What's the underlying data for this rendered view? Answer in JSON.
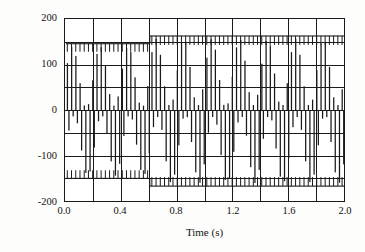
{
  "chart_data": {
    "type": "line",
    "title": "",
    "xlabel": "Time (s)",
    "ylabel": "Terminal voltage (V)",
    "xlim": [
      0.0,
      2.0
    ],
    "ylim": [
      -200,
      200
    ],
    "grid": true,
    "legend": "none",
    "x_major_ticks": [
      0.0,
      0.4,
      0.8,
      1.2,
      1.6,
      2.0
    ],
    "x_minor_ticks": [
      0.2,
      0.6,
      1.0,
      1.4,
      1.8
    ],
    "x_tick_labels": [
      "0.0",
      "0.4",
      "0.8",
      "1.2",
      "1.6",
      "2.0"
    ],
    "y_major_ticks": [
      -200,
      -100,
      0,
      100,
      200
    ],
    "y_minor_ticks": [
      -150,
      -50,
      50,
      150
    ],
    "y_tick_labels": [
      "200",
      "100",
      "0",
      "-100",
      "-200"
    ],
    "series": [
      {
        "name": "Terminal voltage",
        "description": "High-frequency PWM inverter terminal voltage; dense switched pulse train filling the envelope, with a step increase in peak magnitude at t = 0.6 s",
        "color": "#1a1a1a",
        "waveform": "pwm-switched",
        "carrier_pulses_per_second": 33,
        "fundamental_frequency_hz": 5,
        "envelope_segments": [
          {
            "t_start": 0.0,
            "t_end": 0.6,
            "peak_positive": 148,
            "peak_negative": -148
          },
          {
            "t_start": 0.6,
            "t_end": 2.0,
            "peak_positive": 165,
            "peak_negative": -165
          }
        ],
        "envelope_step_time": 0.6,
        "peak_before_step": 148,
        "peak_after_step": 165
      }
    ]
  },
  "axes": {
    "y_title": "Terminal voltage (V)",
    "x_title": "Time (s)",
    "y_labels": [
      "200",
      "100",
      "0",
      "-100",
      "-200"
    ],
    "x_labels": [
      "0.0",
      "0.4",
      "0.8",
      "1.2",
      "1.6",
      "2.0"
    ]
  },
  "colors": {
    "ink": "#1a1a1a",
    "paper": "#fdfdfb",
    "plot_background": "#ffffff"
  }
}
